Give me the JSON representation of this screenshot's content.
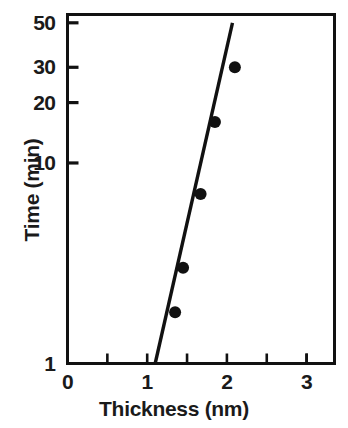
{
  "chart_data": {
    "type": "scatter",
    "title": "",
    "xlabel": "Thickness  (nm)",
    "ylabel": "Time (min)",
    "xlim": [
      0,
      3.35
    ],
    "ylim": [
      1,
      55
    ],
    "yscale": "log",
    "xscale": "linear",
    "grid": false,
    "legend": null,
    "x_major_ticks": [
      0,
      1,
      2,
      3
    ],
    "x_major_tick_labels": [
      "0",
      "1",
      "2",
      "3"
    ],
    "x_minor_ticks": [
      0.5,
      1.5,
      2.5,
      3.0
    ],
    "y_major_ticks": [
      1,
      10,
      20,
      30,
      50
    ],
    "y_major_tick_labels": [
      "1",
      "10",
      "20",
      "30",
      "50"
    ],
    "points": [
      {
        "x": 1.35,
        "y": 1.8
      },
      {
        "x": 1.45,
        "y": 3.0
      },
      {
        "x": 1.67,
        "y": 7.0
      },
      {
        "x": 1.85,
        "y": 16.0
      },
      {
        "x": 2.1,
        "y": 30.0
      }
    ],
    "fit_line": {
      "x0": 1.1,
      "y0": 1.0,
      "x1": 2.07,
      "y1": 50.0
    },
    "marker": {
      "shape": "circle",
      "color": "#111111",
      "size": 6
    },
    "line": {
      "color": "#111111",
      "width": 3
    },
    "frame_color": "#111111",
    "background": "#ffffff"
  },
  "axes": {
    "y_labels": [
      "50",
      "30",
      "20",
      "10",
      "1"
    ],
    "x_labels": [
      "0",
      "1",
      "2",
      "3"
    ],
    "x_title": "Thickness  (nm)",
    "y_title": "Time (min)"
  }
}
